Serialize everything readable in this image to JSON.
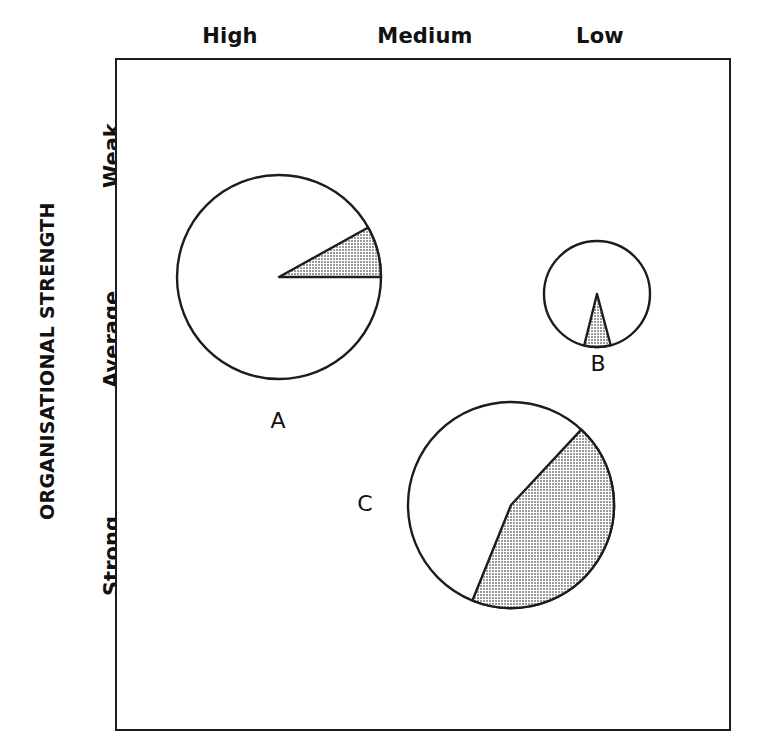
{
  "figure": {
    "axis_title_y": "ORGANISATIONAL STRENGTH",
    "column_labels": [
      "High",
      "Medium",
      "Low"
    ],
    "row_labels": [
      "Weak",
      "Average",
      "Strong"
    ],
    "pie_labels": [
      "A",
      "B",
      "C"
    ],
    "colors": {
      "outline": "#1c1c1c",
      "shaded": "#b7b7b7",
      "unshaded": "#ffffff",
      "text": "#111111"
    }
  },
  "chart_data": {
    "type": "pie",
    "title": "",
    "xlabel": "",
    "ylabel": "ORGANISATIONAL STRENGTH",
    "x_categories": [
      "High",
      "Medium",
      "Low"
    ],
    "y_categories": [
      "Weak",
      "Average",
      "Strong"
    ],
    "grid": false,
    "legend": "none",
    "note": "Bubble-style matrix of three proportional pie charts; bubble radius encodes magnitude, shaded slice encodes share.",
    "pies": [
      {
        "name": "A",
        "cx": 279,
        "cy": 277,
        "radius": 102,
        "x_category": "High",
        "y_category": "Weak",
        "slices": [
          {
            "name": "shaded",
            "value": 8,
            "color": "#b7b7b7"
          },
          {
            "name": "unshaded",
            "value": 92,
            "color": "#ffffff"
          }
        ],
        "shaded_start_deg": 0,
        "shaded_end_deg": 29
      },
      {
        "name": "B",
        "cx": 597,
        "cy": 294,
        "radius": 53,
        "x_category": "Low",
        "y_category": "Average",
        "slices": [
          {
            "name": "shaded",
            "value": 8,
            "color": "#b7b7b7"
          },
          {
            "name": "unshaded",
            "value": 92,
            "color": "#ffffff"
          }
        ],
        "shaded_start_deg": 256,
        "shaded_end_deg": 285
      },
      {
        "name": "C",
        "cx": 511,
        "cy": 505,
        "radius": 103,
        "x_category": "Medium",
        "y_category": "Strong",
        "slices": [
          {
            "name": "shaded",
            "value": 56,
            "color": "#b7b7b7"
          },
          {
            "name": "unshaded",
            "value": 44,
            "color": "#ffffff"
          }
        ],
        "shaded_start_deg": 248,
        "shaded_end_deg": 47
      }
    ]
  }
}
